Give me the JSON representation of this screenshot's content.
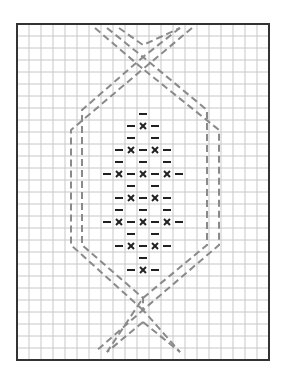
{
  "diagram": {
    "type": "knitting-chart",
    "grid": {
      "columns": 21,
      "rows": 28,
      "cell_size": 12,
      "origin_x": 17,
      "origin_y": 24,
      "line_color": "#c8c8c8",
      "border_color": "#333333"
    },
    "symbols": {
      "dash": {
        "glyph": "purl-dash",
        "color": "#222222"
      },
      "x": {
        "glyph": "cross-stitch-x",
        "color": "#222222"
      }
    },
    "pattern_rows": [
      {
        "row": 7,
        "cells": [
          [
            10,
            "-"
          ]
        ]
      },
      {
        "row": 8,
        "cells": [
          [
            9,
            "-"
          ],
          [
            10,
            "x"
          ],
          [
            11,
            "-"
          ]
        ]
      },
      {
        "row": 9,
        "cells": [
          [
            9,
            "-"
          ],
          [
            11,
            "-"
          ]
        ]
      },
      {
        "row": 10,
        "cells": [
          [
            8,
            "-"
          ],
          [
            9,
            "x"
          ],
          [
            10,
            "-"
          ],
          [
            11,
            "x"
          ],
          [
            12,
            "-"
          ]
        ]
      },
      {
        "row": 11,
        "cells": [
          [
            8,
            "-"
          ],
          [
            10,
            "-"
          ],
          [
            12,
            "-"
          ]
        ]
      },
      {
        "row": 12,
        "cells": [
          [
            7,
            "-"
          ],
          [
            8,
            "x"
          ],
          [
            9,
            "-"
          ],
          [
            10,
            "x"
          ],
          [
            11,
            "-"
          ],
          [
            12,
            "x"
          ],
          [
            13,
            "-"
          ]
        ]
      },
      {
        "row": 13,
        "cells": [
          [
            9,
            "-"
          ],
          [
            11,
            "-"
          ]
        ]
      },
      {
        "row": 14,
        "cells": [
          [
            8,
            "-"
          ],
          [
            9,
            "x"
          ],
          [
            10,
            "-"
          ],
          [
            11,
            "x"
          ],
          [
            12,
            "-"
          ]
        ]
      },
      {
        "row": 15,
        "cells": [
          [
            8,
            "-"
          ],
          [
            10,
            "-"
          ],
          [
            12,
            "-"
          ]
        ]
      },
      {
        "row": 16,
        "cells": [
          [
            7,
            "-"
          ],
          [
            8,
            "x"
          ],
          [
            9,
            "-"
          ],
          [
            10,
            "x"
          ],
          [
            11,
            "-"
          ],
          [
            12,
            "x"
          ],
          [
            13,
            "-"
          ]
        ]
      },
      {
        "row": 17,
        "cells": [
          [
            9,
            "-"
          ],
          [
            11,
            "-"
          ]
        ]
      },
      {
        "row": 18,
        "cells": [
          [
            8,
            "-"
          ],
          [
            9,
            "x"
          ],
          [
            10,
            "-"
          ],
          [
            11,
            "x"
          ],
          [
            12,
            "-"
          ]
        ]
      },
      {
        "row": 19,
        "cells": [
          [
            10,
            "-"
          ]
        ]
      },
      {
        "row": 20,
        "cells": [
          [
            9,
            "-"
          ],
          [
            10,
            "x"
          ],
          [
            11,
            "-"
          ]
        ]
      }
    ],
    "cable_lines": {
      "color": "#8a8a8a",
      "dash": "7 4",
      "width": 2,
      "paths": [
        "M107,28 L143,57 L82,110 L82,245 L143,298 L143,310 L180,352",
        "M119,28 L143,45 L180,28",
        "M95,28 L143,69 L71,130 L71,245 L143,310",
        "M180,28 L143,57 L207,110 L207,245 L143,298 L107,352",
        "M192,28 L143,69 L219,130 L219,245 L143,310 L95,352",
        "M143,322 L107,352",
        "M143,322 L180,352"
      ]
    }
  }
}
